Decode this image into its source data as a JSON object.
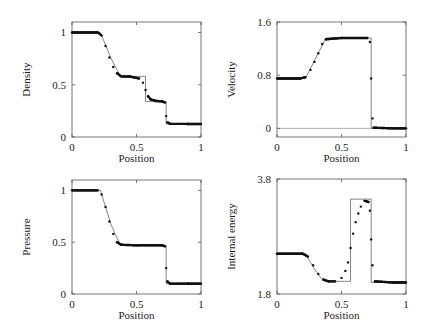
{
  "chart_data": [
    {
      "type": "line",
      "title": "",
      "xlabel": "Position",
      "ylabel": "Density",
      "xlim": [
        0,
        1
      ],
      "ylim": [
        0,
        1.1
      ],
      "xticks": [
        "0",
        "0.5",
        "1"
      ],
      "yticks": [
        "0",
        "0.5",
        "1"
      ],
      "grid": false,
      "series": [
        {
          "name": "exact",
          "style": "thin line",
          "x": [
            0,
            0.22,
            0.26,
            0.3,
            0.34,
            0.38,
            0.57,
            0.57,
            0.73,
            0.73,
            1
          ],
          "y": [
            1.0,
            1.0,
            0.88,
            0.76,
            0.66,
            0.58,
            0.58,
            0.34,
            0.34,
            0.125,
            0.125
          ]
        },
        {
          "name": "numerical",
          "style": "dots",
          "x": [
            0.2,
            0.23,
            0.26,
            0.29,
            0.32,
            0.35,
            0.38,
            0.45,
            0.52,
            0.55,
            0.57,
            0.59,
            0.61,
            0.65,
            0.7,
            0.72,
            0.73,
            0.74,
            0.76,
            0.9
          ],
          "y": [
            1.0,
            0.97,
            0.87,
            0.76,
            0.67,
            0.61,
            0.58,
            0.578,
            0.56,
            0.52,
            0.45,
            0.39,
            0.36,
            0.345,
            0.34,
            0.33,
            0.2,
            0.14,
            0.126,
            0.125
          ]
        }
      ]
    },
    {
      "type": "line",
      "title": "",
      "xlabel": "Position",
      "ylabel": "Velocity",
      "xlim": [
        0,
        1
      ],
      "ylim": [
        -0.13,
        1.6
      ],
      "xticks": [
        "0",
        "0.5",
        "1"
      ],
      "yticks": [
        "0",
        "0.8",
        "1.6"
      ],
      "grid": false,
      "series": [
        {
          "name": "exact",
          "style": "thin line",
          "x": [
            0,
            0.22,
            0.38,
            0.73,
            0.73,
            1
          ],
          "y": [
            0.75,
            0.75,
            1.36,
            1.36,
            0,
            0
          ]
        },
        {
          "name": "numerical",
          "style": "dots",
          "x": [
            0.18,
            0.22,
            0.26,
            0.29,
            0.32,
            0.35,
            0.38,
            0.5,
            0.7,
            0.72,
            0.73,
            0.74,
            0.75,
            0.9
          ],
          "y": [
            0.75,
            0.77,
            0.88,
            1.0,
            1.13,
            1.27,
            1.34,
            1.36,
            1.36,
            1.3,
            0.75,
            0.15,
            0.01,
            0
          ]
        }
      ]
    },
    {
      "type": "line",
      "title": "",
      "xlabel": "Position",
      "ylabel": "Pressure",
      "xlim": [
        0,
        1
      ],
      "ylim": [
        0,
        1.1
      ],
      "xticks": [
        "0",
        "0.5",
        "1"
      ],
      "yticks": [
        "0",
        "0.5",
        "1"
      ],
      "grid": false,
      "series": [
        {
          "name": "exact",
          "style": "thin line",
          "x": [
            0,
            0.22,
            0.26,
            0.3,
            0.34,
            0.38,
            0.73,
            0.73,
            1
          ],
          "y": [
            1.0,
            1.0,
            0.84,
            0.68,
            0.56,
            0.47,
            0.47,
            0.1,
            0.1
          ]
        },
        {
          "name": "numerical",
          "style": "dots",
          "x": [
            0.2,
            0.23,
            0.26,
            0.29,
            0.32,
            0.35,
            0.38,
            0.5,
            0.7,
            0.72,
            0.73,
            0.74,
            0.76,
            0.9
          ],
          "y": [
            1.0,
            0.96,
            0.84,
            0.7,
            0.58,
            0.5,
            0.475,
            0.47,
            0.47,
            0.46,
            0.25,
            0.12,
            0.1,
            0.1
          ]
        }
      ]
    },
    {
      "type": "line",
      "title": "",
      "xlabel": "Position",
      "ylabel": "Internal energy",
      "xlim": [
        0,
        1
      ],
      "ylim": [
        1.8,
        3.8
      ],
      "xticks": [
        "0",
        "0.5",
        "1"
      ],
      "yticks": [
        "1.8",
        "3.8"
      ],
      "grid": false,
      "series": [
        {
          "name": "exact",
          "style": "thin line",
          "x": [
            0,
            0.22,
            0.26,
            0.3,
            0.34,
            0.38,
            0.57,
            0.57,
            0.73,
            0.73,
            1
          ],
          "y": [
            2.5,
            2.5,
            2.35,
            2.2,
            2.08,
            2.02,
            2.02,
            3.45,
            3.45,
            2.0,
            2.0
          ]
        },
        {
          "name": "numerical",
          "style": "dots",
          "x": [
            0.2,
            0.24,
            0.28,
            0.32,
            0.36,
            0.4,
            0.45,
            0.5,
            0.53,
            0.55,
            0.57,
            0.59,
            0.61,
            0.63,
            0.65,
            0.68,
            0.71,
            0.72,
            0.73,
            0.74,
            0.76,
            0.9
          ],
          "y": [
            2.5,
            2.45,
            2.3,
            2.15,
            2.05,
            2.02,
            2.02,
            2.08,
            2.2,
            2.35,
            2.6,
            2.85,
            3.05,
            3.2,
            3.32,
            3.42,
            3.4,
            3.25,
            2.75,
            2.3,
            2.02,
            2.0
          ]
        }
      ]
    }
  ],
  "panels": [
    {
      "ylabel": "Density",
      "xlabel": "Position",
      "xticks": [
        "0",
        "0.5",
        "1"
      ],
      "yticks": [
        "1",
        "0.5",
        "0"
      ]
    },
    {
      "ylabel": "Velocity",
      "xlabel": "Position",
      "xticks": [
        "0",
        "0.5",
        "1"
      ],
      "yticks": [
        "1.6",
        "0.8",
        "0"
      ]
    },
    {
      "ylabel": "Pressure",
      "xlabel": "Position",
      "xticks": [
        "0",
        "0.5",
        "1"
      ],
      "yticks": [
        "1",
        "0.5",
        "0"
      ]
    },
    {
      "ylabel": "Internal energy",
      "xlabel": "Position",
      "xticks": [
        "0",
        "0.5",
        "1"
      ],
      "yticks": [
        "3.8",
        "1.8"
      ]
    }
  ]
}
